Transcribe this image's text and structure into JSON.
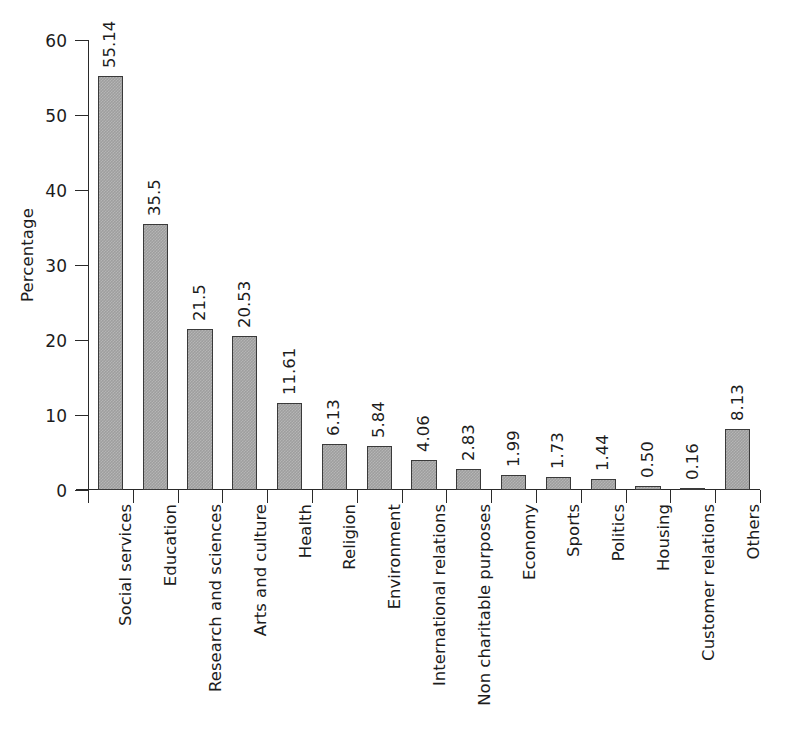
{
  "chart_data": {
    "type": "bar",
    "title": "",
    "subtitle": "",
    "xlabel": "",
    "ylabel": "Percentage",
    "ylim": [
      0,
      60
    ],
    "yticks": [
      0,
      10,
      20,
      30,
      40,
      50,
      60
    ],
    "ytick_labels": [
      "0",
      "10",
      "20",
      "30",
      "40",
      "50",
      "60"
    ],
    "grid": false,
    "legend": null,
    "bar_color": "#9e9e9e",
    "bar_edge_color": "#3a3a3a",
    "value_label_rotation": 90,
    "category_label_rotation": 90,
    "categories": [
      "Social services",
      "Education",
      "Research and sciences",
      "Arts and culture",
      "Health",
      "Religion",
      "Environment",
      "International relations",
      "Non charitable purposes",
      "Economy",
      "Sports",
      "Politics",
      "Housing",
      "Customer relations",
      "Others"
    ],
    "values": [
      55.14,
      35.5,
      21.5,
      20.53,
      11.61,
      6.13,
      5.84,
      4.06,
      2.83,
      1.99,
      1.73,
      1.44,
      0.5,
      0.16,
      8.13
    ],
    "value_labels": [
      "55.14",
      "35.5",
      "21.5",
      "20.53",
      "11.61",
      "6.13",
      "5.84",
      "4.06",
      "2.83",
      "1.99",
      "1.73",
      "1.44",
      "0.50",
      "0.16",
      "8.13"
    ]
  }
}
